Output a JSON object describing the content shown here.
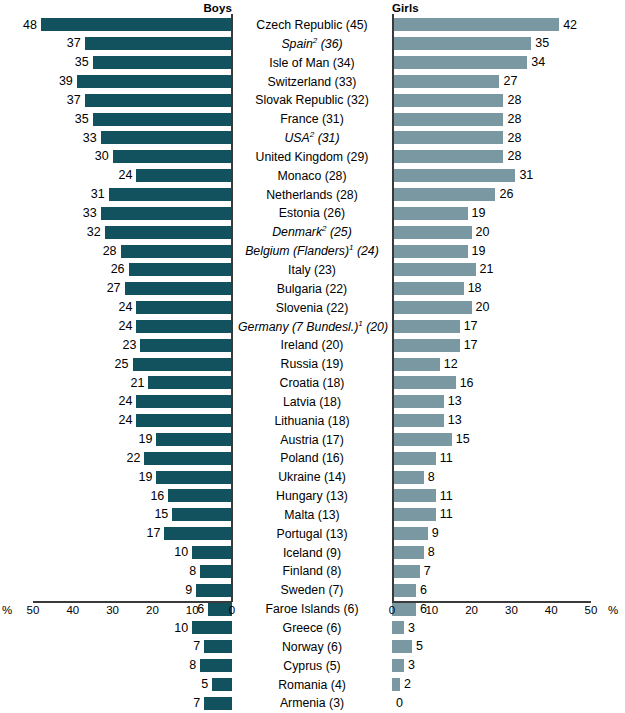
{
  "header": {
    "left_title": "Boys",
    "right_title": "Girls"
  },
  "axis": {
    "unit": "%",
    "left_ticks": [
      "50",
      "40",
      "30",
      "20",
      "10",
      "0"
    ],
    "right_ticks": [
      "0",
      "10",
      "20",
      "30",
      "40",
      "50"
    ]
  },
  "colors": {
    "boys_bar": "#12525e",
    "girls_bar": "#7a98a1",
    "axis": "#3a3a3a",
    "text": "#000000"
  },
  "chart_data": {
    "type": "bar",
    "title": "",
    "subtype": "diverging-paired-horizontal",
    "xlabel": "%",
    "ylabel": "",
    "xlim": [
      0,
      50
    ],
    "grid": false,
    "left_axis_direction": "reversed",
    "legend": [
      "Boys",
      "Girls"
    ],
    "categories": [
      "Czech Republic (45)",
      "Spain2 (36)",
      "Isle of Man (34)",
      "Switzerland (33)",
      "Slovak Republic (32)",
      "France (31)",
      "USA2 (31)",
      "United Kingdom (29)",
      "Monaco (28)",
      "Netherlands (28)",
      "Estonia (26)",
      "Denmark2 (25)",
      "Belgium (Flanders)1 (24)",
      "Italy (23)",
      "Bulgaria (22)",
      "Slovenia (22)",
      "Germany (7 Bundesl.)1 (20)",
      "Ireland (20)",
      "Russia (19)",
      "Croatia (18)",
      "Latvia (18)",
      "Lithuania (18)",
      "Austria (17)",
      "Poland (16)",
      "Ukraine (14)",
      "Hungary (13)",
      "Malta (13)",
      "Portugal (13)",
      "Iceland (9)",
      "Finland (8)",
      "Sweden (7)",
      "Faroe Islands (6)",
      "Greece (6)",
      "Norway (6)",
      "Cyprus (5)",
      "Romania (4)",
      "Armenia (3)"
    ],
    "series": [
      {
        "name": "Boys",
        "values": [
          48,
          37,
          35,
          39,
          37,
          35,
          33,
          30,
          24,
          31,
          33,
          32,
          28,
          26,
          27,
          24,
          24,
          23,
          25,
          21,
          24,
          24,
          19,
          22,
          19,
          16,
          15,
          17,
          10,
          8,
          9,
          6,
          10,
          7,
          8,
          5,
          7
        ]
      },
      {
        "name": "Girls",
        "values": [
          42,
          35,
          34,
          27,
          28,
          28,
          28,
          28,
          31,
          26,
          19,
          20,
          19,
          21,
          18,
          20,
          17,
          17,
          12,
          16,
          13,
          13,
          15,
          11,
          8,
          11,
          11,
          9,
          8,
          7,
          6,
          6,
          3,
          5,
          3,
          2,
          0
        ]
      }
    ]
  },
  "rows": [
    {
      "label": "Czech Republic",
      "note": "(45)",
      "italic": false,
      "sup": "",
      "boys": 48,
      "girls": 42
    },
    {
      "label": "Spain",
      "note": "(36)",
      "italic": true,
      "sup": "2",
      "boys": 37,
      "girls": 35
    },
    {
      "label": "Isle of Man",
      "note": "(34)",
      "italic": false,
      "sup": "",
      "boys": 35,
      "girls": 34
    },
    {
      "label": "Switzerland",
      "note": "(33)",
      "italic": false,
      "sup": "",
      "boys": 39,
      "girls": 27
    },
    {
      "label": "Slovak Republic",
      "note": "(32)",
      "italic": false,
      "sup": "",
      "boys": 37,
      "girls": 28
    },
    {
      "label": "France",
      "note": "(31)",
      "italic": false,
      "sup": "",
      "boys": 35,
      "girls": 28
    },
    {
      "label": "USA",
      "note": "(31)",
      "italic": true,
      "sup": "2",
      "boys": 33,
      "girls": 28
    },
    {
      "label": "United Kingdom",
      "note": "(29)",
      "italic": false,
      "sup": "",
      "boys": 30,
      "girls": 28
    },
    {
      "label": "Monaco",
      "note": "(28)",
      "italic": false,
      "sup": "",
      "boys": 24,
      "girls": 31
    },
    {
      "label": "Netherlands",
      "note": "(28)",
      "italic": false,
      "sup": "",
      "boys": 31,
      "girls": 26
    },
    {
      "label": "Estonia",
      "note": "(26)",
      "italic": false,
      "sup": "",
      "boys": 33,
      "girls": 19
    },
    {
      "label": "Denmark",
      "note": "(25)",
      "italic": true,
      "sup": "2",
      "boys": 32,
      "girls": 20
    },
    {
      "label": "Belgium (Flanders)",
      "note": "(24)",
      "italic": true,
      "sup": "1",
      "boys": 28,
      "girls": 19
    },
    {
      "label": "Italy",
      "note": "(23)",
      "italic": false,
      "sup": "",
      "boys": 26,
      "girls": 21
    },
    {
      "label": "Bulgaria",
      "note": "(22)",
      "italic": false,
      "sup": "",
      "boys": 27,
      "girls": 18
    },
    {
      "label": "Slovenia",
      "note": "(22)",
      "italic": false,
      "sup": "",
      "boys": 24,
      "girls": 20
    },
    {
      "label": "Germany (7 Bundesl.)",
      "note": "(20)",
      "italic": true,
      "sup": "1",
      "boys": 24,
      "girls": 17
    },
    {
      "label": "Ireland",
      "note": "(20)",
      "italic": false,
      "sup": "",
      "boys": 23,
      "girls": 17
    },
    {
      "label": "Russia",
      "note": "(19)",
      "italic": false,
      "sup": "",
      "boys": 25,
      "girls": 12
    },
    {
      "label": "Croatia",
      "note": "(18)",
      "italic": false,
      "sup": "",
      "boys": 21,
      "girls": 16
    },
    {
      "label": "Latvia",
      "note": "(18)",
      "italic": false,
      "sup": "",
      "boys": 24,
      "girls": 13
    },
    {
      "label": "Lithuania",
      "note": "(18)",
      "italic": false,
      "sup": "",
      "boys": 24,
      "girls": 13
    },
    {
      "label": "Austria",
      "note": "(17)",
      "italic": false,
      "sup": "",
      "boys": 19,
      "girls": 15
    },
    {
      "label": "Poland",
      "note": "(16)",
      "italic": false,
      "sup": "",
      "boys": 22,
      "girls": 11
    },
    {
      "label": "Ukraine",
      "note": "(14)",
      "italic": false,
      "sup": "",
      "boys": 19,
      "girls": 8
    },
    {
      "label": "Hungary",
      "note": "(13)",
      "italic": false,
      "sup": "",
      "boys": 16,
      "girls": 11
    },
    {
      "label": "Malta",
      "note": "(13)",
      "italic": false,
      "sup": "",
      "boys": 15,
      "girls": 11
    },
    {
      "label": "Portugal",
      "note": "(13)",
      "italic": false,
      "sup": "",
      "boys": 17,
      "girls": 9
    },
    {
      "label": "Iceland",
      "note": "(9)",
      "italic": false,
      "sup": "",
      "boys": 10,
      "girls": 8
    },
    {
      "label": "Finland",
      "note": "(8)",
      "italic": false,
      "sup": "",
      "boys": 8,
      "girls": 7
    },
    {
      "label": "Sweden",
      "note": "(7)",
      "italic": false,
      "sup": "",
      "boys": 9,
      "girls": 6
    },
    {
      "label": "Faroe Islands",
      "note": "(6)",
      "italic": false,
      "sup": "",
      "boys": 6,
      "girls": 6
    },
    {
      "label": "Greece",
      "note": "(6)",
      "italic": false,
      "sup": "",
      "boys": 10,
      "girls": 3
    },
    {
      "label": "Norway",
      "note": "(6)",
      "italic": false,
      "sup": "",
      "boys": 7,
      "girls": 5
    },
    {
      "label": "Cyprus",
      "note": "(5)",
      "italic": false,
      "sup": "",
      "boys": 8,
      "girls": 3
    },
    {
      "label": "Romania",
      "note": "(4)",
      "italic": false,
      "sup": "",
      "boys": 5,
      "girls": 2
    },
    {
      "label": "Armenia",
      "note": "(3)",
      "italic": false,
      "sup": "",
      "boys": 7,
      "girls": 0
    }
  ]
}
